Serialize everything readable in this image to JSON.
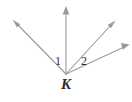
{
  "figure": {
    "kind": "geometry-angle-diagram",
    "width": 132,
    "height": 102,
    "background_color": "#ffffff",
    "line_color": "#9a9a9a",
    "label_color": "#2b2b2b",
    "vertex": {
      "name": "K",
      "x": 66,
      "y": 74
    },
    "angle_labels": [
      {
        "text": "1",
        "x": 55,
        "y": 55
      },
      {
        "text": "2",
        "x": 81,
        "y": 55
      }
    ],
    "rays": [
      {
        "id": "ray-upper-left",
        "icon": "ray-arrow-icon",
        "from_x": 66,
        "from_y": 74,
        "to_x": 14,
        "to_y": 21
      },
      {
        "id": "ray-vertical-up",
        "icon": "ray-arrow-icon",
        "from_x": 66,
        "from_y": 74,
        "to_x": 66,
        "to_y": 7
      },
      {
        "id": "ray-upper-right",
        "icon": "ray-arrow-icon",
        "from_x": 66,
        "from_y": 74,
        "to_x": 114,
        "to_y": 22
      },
      {
        "id": "ray-right",
        "icon": "ray-arrow-icon",
        "from_x": 66,
        "from_y": 74,
        "to_x": 128,
        "to_y": 45
      }
    ]
  }
}
